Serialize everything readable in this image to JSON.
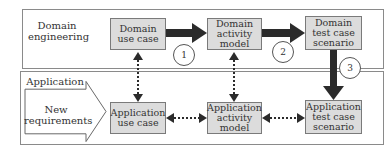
{
  "domain_panel": {
    "title_line1": "Domain",
    "title_line2": "engineering",
    "boxes": [
      {
        "line1": "Domain",
        "line2": "use case"
      },
      {
        "line1": "Domain",
        "line2": "activity",
        "line3": "model"
      },
      {
        "line1": "Domain",
        "line2": "test case",
        "line3": "scenario"
      }
    ]
  },
  "application_panel": {
    "title_line1": "Application",
    "title_line2": "engineering",
    "input_arrow": {
      "line1": "New",
      "line2": "requirements"
    },
    "boxes": [
      {
        "line1": "Application",
        "line2": "use case"
      },
      {
        "line1": "Application",
        "line2": "activity",
        "line3": "model"
      },
      {
        "line1": "Application",
        "line2": "test case",
        "line3": "scenario"
      }
    ]
  },
  "steps": [
    "1",
    "2",
    "3"
  ],
  "colors": {
    "box_fill": "#dcdcdc",
    "arrow": "#2b2b2b",
    "border": "#8a8a8a"
  }
}
